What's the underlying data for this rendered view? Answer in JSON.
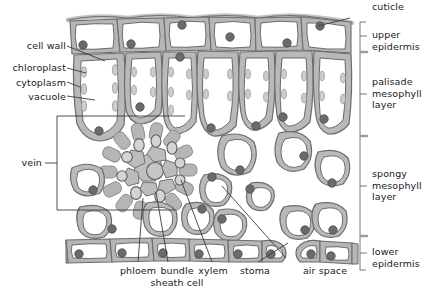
{
  "diagram": {
    "colors": {
      "wall": "#b0b0b0",
      "wall_dark": "#8f8f8f",
      "outline": "#4d4d4d",
      "cytoplasm": "#c9c9c9",
      "vacuole": "#ffffff",
      "chloroplast": "#cdcdcd",
      "nucleus": "#6b6b6b",
      "bundle_sheath": "#b5b5b5",
      "phloem": "#d2d2d2",
      "xylem": "#c4c4c4",
      "leader": "#3a3a3a",
      "text": "#1a1a1a"
    }
  },
  "labels_left": [
    {
      "id": "cell-wall",
      "text": "cell wall"
    },
    {
      "id": "chloroplast",
      "text": "chloroplast"
    },
    {
      "id": "cytoplasm",
      "text": "cytoplasm"
    },
    {
      "id": "vacuole",
      "text": "vacuole"
    },
    {
      "id": "vein",
      "text": "vein"
    }
  ],
  "labels_right": [
    {
      "id": "cuticle",
      "text": "cuticle"
    },
    {
      "id": "upper-epidermis",
      "text": "upper\nepidermis"
    },
    {
      "id": "palisade",
      "text": "palisade\nmesophyll\nlayer"
    },
    {
      "id": "spongy",
      "text": "spongy\nmesophyll\nlayer"
    },
    {
      "id": "lower-epidermis",
      "text": "lower\nepidermis"
    }
  ],
  "labels_bottom": [
    {
      "id": "phloem",
      "text": "phloem"
    },
    {
      "id": "bundle-sheath-cell",
      "text": "bundle\nsheath cell"
    },
    {
      "id": "xylem",
      "text": "xylem"
    },
    {
      "id": "stoma",
      "text": "stoma"
    },
    {
      "id": "air-space",
      "text": "air space"
    }
  ],
  "structures": {
    "upper_epidermis_cells": 6,
    "palisade_cells": 7,
    "spongy_cells": 12,
    "lower_epidermis_cells": 9,
    "bundle_sheath_ring_cells": 14,
    "phloem_cells": 9,
    "xylem_cells": 7,
    "stomata": 1
  }
}
